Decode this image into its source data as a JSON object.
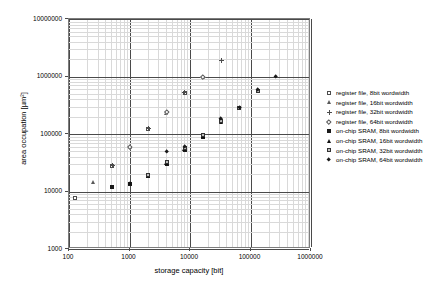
{
  "chart_data": {
    "type": "scatter",
    "title": "",
    "xlabel": "storage capacity [bit]",
    "ylabel": "area occupation [µm²]",
    "xscale": "log",
    "yscale": "log",
    "xlim": [
      100,
      1000000
    ],
    "ylim": [
      1000,
      10000000
    ],
    "xticks": [
      "100",
      "1000",
      "10000",
      "100000",
      "1000000"
    ],
    "yticks": [
      "1000",
      "10000",
      "100000",
      "1000000",
      "10000000"
    ],
    "grid": "log-minor-both-axes",
    "legend_position": "right",
    "series": [
      {
        "name": "register file, 8bit wordwidth",
        "marker": "open-square",
        "points": [
          {
            "x": 128,
            "y": 7800
          },
          {
            "x": 512,
            "y": 28000
          },
          {
            "x": 2048,
            "y": 124000
          },
          {
            "x": 8192,
            "y": 520000
          }
        ]
      },
      {
        "name": "register file, 16bit wordwidth",
        "marker": "open-triangle",
        "points": [
          {
            "x": 256,
            "y": 14500
          },
          {
            "x": 1024,
            "y": 60000
          },
          {
            "x": 4096,
            "y": 235000
          },
          {
            "x": 16384,
            "y": 1000000
          }
        ]
      },
      {
        "name": "register file, 32bit wordwidth",
        "marker": "plus",
        "points": [
          {
            "x": 512,
            "y": 28000
          },
          {
            "x": 2048,
            "y": 124000
          },
          {
            "x": 8192,
            "y": 520000
          },
          {
            "x": 32768,
            "y": 1900000
          }
        ]
      },
      {
        "name": "register file, 64bit wordwidth",
        "marker": "open-diamond",
        "points": [
          {
            "x": 1024,
            "y": 60000
          },
          {
            "x": 4096,
            "y": 245000
          },
          {
            "x": 16384,
            "y": 1000000
          }
        ]
      },
      {
        "name": "on-chip SRAM, 8bit wordwidth",
        "marker": "filled-square",
        "points": [
          {
            "x": 512,
            "y": 12000
          },
          {
            "x": 1024,
            "y": 13500
          },
          {
            "x": 2048,
            "y": 18500
          },
          {
            "x": 4096,
            "y": 30000
          },
          {
            "x": 8192,
            "y": 52000
          },
          {
            "x": 16384,
            "y": 88000
          }
        ]
      },
      {
        "name": "on-chip SRAM, 16bit wordwidth",
        "marker": "filled-triangle",
        "points": [
          {
            "x": 1024,
            "y": 14000
          },
          {
            "x": 2048,
            "y": 19000
          },
          {
            "x": 4096,
            "y": 31000
          },
          {
            "x": 8192,
            "y": 54000
          },
          {
            "x": 16384,
            "y": 92000
          },
          {
            "x": 32768,
            "y": 160000
          }
        ]
      },
      {
        "name": "on-chip SRAM, 32bit wordwidth",
        "marker": "half-square",
        "points": [
          {
            "x": 2048,
            "y": 19500
          },
          {
            "x": 4096,
            "y": 32000
          },
          {
            "x": 8192,
            "y": 57000
          },
          {
            "x": 16384,
            "y": 95000
          },
          {
            "x": 32768,
            "y": 170000
          },
          {
            "x": 65536,
            "y": 280000
          },
          {
            "x": 131072,
            "y": 560000
          }
        ]
      },
      {
        "name": "on-chip SRAM, 64bit wordwidth",
        "marker": "filled-diamond",
        "points": [
          {
            "x": 4096,
            "y": 50000
          },
          {
            "x": 8192,
            "y": 60000
          },
          {
            "x": 32768,
            "y": 185000
          },
          {
            "x": 65536,
            "y": 285000
          },
          {
            "x": 131072,
            "y": 580000
          },
          {
            "x": 262144,
            "y": 1000000
          }
        ]
      }
    ]
  },
  "legend": {
    "items": [
      {
        "label": "register file, 8bit wordwidth",
        "marker": "open-square"
      },
      {
        "label": "register file, 16bit wordwidth",
        "marker": "open-triangle"
      },
      {
        "label": "register file, 32bit wordwidth",
        "marker": "plus"
      },
      {
        "label": "register file, 64bit wordwidth",
        "marker": "open-diamond"
      },
      {
        "label": "on-chip SRAM, 8bit wordwidth",
        "marker": "filled-square"
      },
      {
        "label": "on-chip SRAM, 16bit wordwidth",
        "marker": "filled-triangle"
      },
      {
        "label": "on-chip SRAM, 32bit wordwidth",
        "marker": "half-square"
      },
      {
        "label": "on-chip SRAM, 64bit wordwidth",
        "marker": "filled-diamond"
      }
    ]
  },
  "colors": {
    "grid_minor": "#d9d9d9",
    "grid_major": "#4a4a4a",
    "frame": "#7d7d7d",
    "marker_open": "#4d4d4d",
    "marker_filled": "#1a1a1a",
    "background": "#ffffff"
  }
}
